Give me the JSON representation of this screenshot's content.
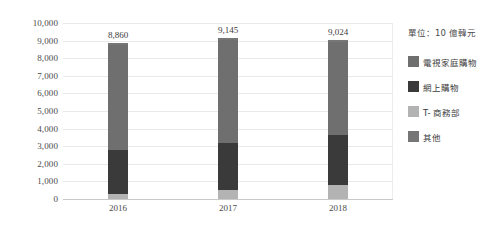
{
  "chart_data": {
    "type": "bar",
    "subtype": "stacked-column",
    "title": "",
    "xlabel": "",
    "ylabel": "",
    "unit_note": "單位：10 億韓元",
    "categories": [
      "2016",
      "2017",
      "2018"
    ],
    "totals": [
      8860,
      9145,
      9024
    ],
    "total_labels": [
      "8,860",
      "9,145",
      "9,024"
    ],
    "ylim": [
      0,
      10000
    ],
    "ystep": 1000,
    "ytick_labels": [
      "0",
      "1,000",
      "2,000",
      "3,000",
      "4,000",
      "5,000",
      "6,000",
      "7,000",
      "8,000",
      "9,000",
      "10,000"
    ],
    "ytick_values": [
      0,
      1000,
      2000,
      3000,
      4000,
      5000,
      6000,
      7000,
      8000,
      9000,
      10000
    ],
    "grid": true,
    "legend_position": "right",
    "stack_order_bottom_to_top": [
      "T-商務部",
      "網上購物",
      "電視家庭購物",
      "其他"
    ],
    "series": [
      {
        "name": "電視家庭購物",
        "color": "#6f6f6f",
        "values": [
          5960,
          5845,
          5314
        ]
      },
      {
        "name": "網上購物",
        "color": "#3a3a3a",
        "values": [
          2500,
          2700,
          2810
        ]
      },
      {
        "name": "T-商務部",
        "color": "#b3b3b3",
        "values": [
          300,
          500,
          800
        ]
      },
      {
        "name": "其他",
        "color": "#767676",
        "values": [
          100,
          100,
          100
        ]
      }
    ]
  },
  "legend": {
    "items": [
      {
        "label": "電視家庭購物",
        "color": "#6f6f6f"
      },
      {
        "label": "網上購物",
        "color": "#3a3a3a"
      },
      {
        "label": "T- 商務部",
        "color": "#b3b3b3"
      },
      {
        "label": "其他",
        "color": "#767676"
      }
    ]
  }
}
